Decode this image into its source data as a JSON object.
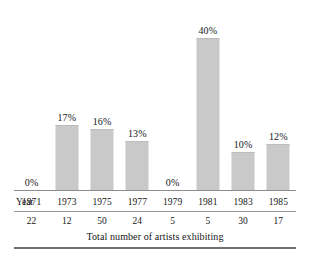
{
  "chart_data": {
    "type": "bar",
    "title": "",
    "subtitle": "",
    "xlabel": "Year",
    "ylabel": "",
    "ylim": [
      0,
      40
    ],
    "grid": false,
    "legend": null,
    "categories": [
      "1971",
      "1973",
      "1975",
      "1977",
      "1979",
      "1981",
      "1983",
      "1985"
    ],
    "values": [
      0,
      17,
      16,
      13,
      0,
      40,
      10,
      12
    ],
    "value_labels": [
      "0%",
      "17%",
      "16%",
      "13%",
      "0%",
      "40%",
      "10%",
      "12%"
    ],
    "series": [
      {
        "name": "Percentage of women artists exhibiting",
        "values": [
          0,
          17,
          16,
          13,
          0,
          40,
          10,
          12
        ]
      }
    ],
    "secondary_axis": {
      "label": "Total number of artists exhibiting",
      "values": [
        22,
        12,
        50,
        24,
        5,
        5,
        30,
        17
      ],
      "value_labels": [
        "22",
        "12",
        "50",
        "24",
        "5",
        "5",
        "30",
        "17"
      ]
    },
    "bar_color": "#c9c9c9",
    "text_color": "#161616",
    "rule_color": "#8c8c8c"
  },
  "axis": {
    "year_row_label": "Year",
    "years": [
      "1971",
      "1973",
      "1975",
      "1977",
      "1979",
      "1981",
      "1985-placeholder",
      "1985"
    ]
  },
  "caption": {
    "text": "Total number of artists exhibiting"
  }
}
